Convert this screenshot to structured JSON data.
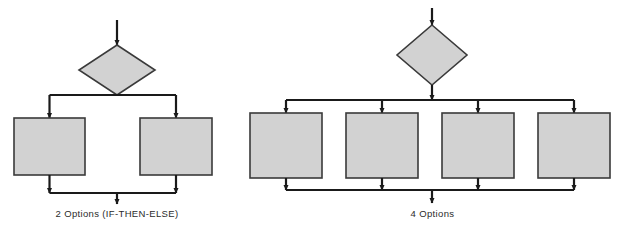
{
  "figure": {
    "background_color": "#ffffff",
    "shape_fill_color": "#d2d2d2",
    "shape_stroke_color": "#3a3a3a",
    "connector_color": "#1a1a1a"
  },
  "diagrams": [
    {
      "id": "two-options",
      "caption": "2 Options (IF-THEN-ELSE)",
      "decision": {
        "shape": "diamond",
        "label": "",
        "center_x": 117,
        "center_y": 70,
        "half_width": 38,
        "half_height": 25
      },
      "entry_arrow": {
        "x": 117,
        "y_start": 20,
        "y_end": 45
      },
      "branch_count": 2,
      "split_bar_y": 95,
      "merge_bar_y": 193,
      "exit_arrow": {
        "x": 117,
        "y_start": 193,
        "y_end": 204
      },
      "boxes": [
        {
          "label": "",
          "x": 14,
          "y": 118,
          "width": 71,
          "height": 57
        },
        {
          "label": "",
          "x": 140,
          "y": 118,
          "width": 72,
          "height": 57
        }
      ]
    },
    {
      "id": "four-options",
      "caption": "4 Options",
      "decision": {
        "shape": "diamond",
        "label": "",
        "center_x": 432,
        "center_y": 55,
        "half_width": 35,
        "half_height": 30
      },
      "entry_arrow": {
        "x": 432,
        "y_start": 8,
        "y_end": 25
      },
      "branch_count": 4,
      "split_bar_y": 100,
      "merge_bar_y": 190,
      "exit_arrow": {
        "x": 432,
        "y_start": 190,
        "y_end": 203
      },
      "boxes": [
        {
          "label": "",
          "x": 250,
          "y": 113,
          "width": 72,
          "height": 65
        },
        {
          "label": "",
          "x": 346,
          "y": 113,
          "width": 72,
          "height": 65
        },
        {
          "label": "",
          "x": 442,
          "y": 113,
          "width": 72,
          "height": 65
        },
        {
          "label": "",
          "x": 538,
          "y": 113,
          "width": 72,
          "height": 65
        }
      ]
    }
  ]
}
